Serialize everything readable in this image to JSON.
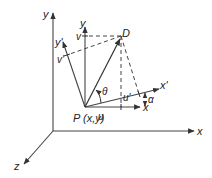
{
  "diagram": {
    "colors": {
      "ink": "#333333",
      "background": "#ffffff"
    },
    "outer_axes": {
      "x_label": "x",
      "y_label": "y",
      "z_label": "z"
    },
    "local_frame": {
      "x_label": "x",
      "y_label": "y",
      "x_prime_label": "x'",
      "y_prime_label": "y'"
    },
    "point_p_label": "P (x,y)",
    "point_d_label": "D",
    "components": {
      "u": "u",
      "v": "v",
      "u_prime": "u'",
      "v_prime": "v'"
    },
    "angles": {
      "theta": "θ",
      "alpha": "α"
    }
  }
}
